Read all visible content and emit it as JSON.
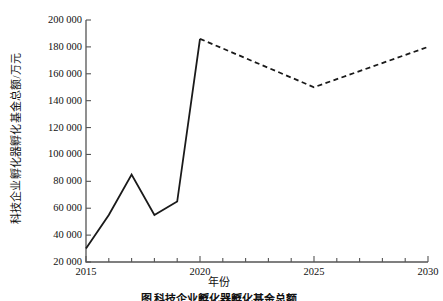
{
  "chart_data": {
    "type": "line",
    "title": "",
    "xlabel": "年份",
    "ylabel": "科技企业孵化器孵化基金总额/万元",
    "xlim": [
      2015,
      2030
    ],
    "ylim": [
      20000,
      200000
    ],
    "grid": false,
    "legend": "none",
    "x_ticks": [
      "2015",
      "2020",
      "2025",
      "2030"
    ],
    "x_tick_values": [
      2015,
      2020,
      2025,
      2030
    ],
    "y_ticks": [
      "20 000",
      "40 000",
      "60 000",
      "80 000",
      "100 000",
      "120 000",
      "140 000",
      "160 000",
      "180 000",
      "200 000"
    ],
    "y_tick_values": [
      20000,
      40000,
      60000,
      80000,
      100000,
      120000,
      140000,
      160000,
      180000,
      200000
    ],
    "minor_x_ticks_per_interval": 1,
    "series": [
      {
        "name": "历史值",
        "style": "solid",
        "color": "#1a1a1a",
        "x": [
          2015,
          2016,
          2017,
          2018,
          2019,
          2020
        ],
        "values": [
          30000,
          55000,
          85000,
          55000,
          65000,
          186000
        ]
      },
      {
        "name": "预测值",
        "style": "dashed",
        "color": "#1a1a1a",
        "x": [
          2020,
          2025,
          2030
        ],
        "values": [
          186000,
          150000,
          180000
        ]
      }
    ]
  },
  "axis": {
    "x_tick_labels": [
      {
        "label": "2015",
        "value": 2015
      },
      {
        "label": "2020",
        "value": 2020
      },
      {
        "label": "2025",
        "value": 2025
      },
      {
        "label": "2030",
        "value": 2030
      }
    ],
    "y_tick_labels": [
      {
        "label": "200 000",
        "value": 200000
      },
      {
        "label": "180 000",
        "value": 180000
      },
      {
        "label": "160 000",
        "value": 160000
      },
      {
        "label": "140 000",
        "value": 140000
      },
      {
        "label": "120 000",
        "value": 120000
      },
      {
        "label": "100 000",
        "value": 100000
      },
      {
        "label": "80 000",
        "value": 80000
      },
      {
        "label": "60 000",
        "value": 60000
      },
      {
        "label": "40 000",
        "value": 40000
      },
      {
        "label": "20 000",
        "value": 20000
      }
    ]
  },
  "caption": {
    "text": "图  科技企业孵化器孵化基金总额"
  },
  "colors": {
    "line": "#1a1a1a",
    "axis": "#555555",
    "text": "#111111",
    "background": "#ffffff"
  }
}
